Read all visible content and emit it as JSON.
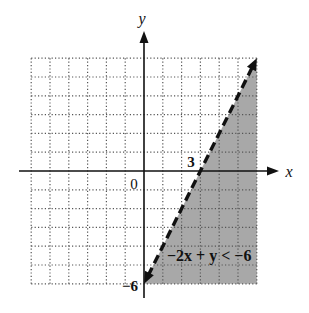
{
  "chart_data": {
    "type": "area",
    "title": "",
    "xlabel": "x",
    "ylabel": "y",
    "xlim": [
      -6,
      6
    ],
    "ylim": [
      -6,
      6
    ],
    "grid": true,
    "grid_style": "dotted",
    "boundary": {
      "equation": "y = 2x - 6",
      "style": "dashed",
      "points": [
        [
          0,
          -6
        ],
        [
          3,
          0
        ],
        [
          6,
          6
        ]
      ]
    },
    "inequality": "-2x + y < -6",
    "shaded_region": "below/right of boundary line",
    "shade_polygon": [
      [
        0,
        -6
      ],
      [
        6,
        6
      ],
      [
        6,
        -6
      ]
    ],
    "annotations": [
      {
        "text": "3",
        "at": [
          3,
          0
        ],
        "meaning": "x-intercept"
      },
      {
        "text": "−6",
        "at": [
          0,
          -6
        ],
        "meaning": "y-intercept"
      },
      {
        "text": "0",
        "at": [
          0,
          0
        ],
        "meaning": "origin"
      }
    ],
    "colors": {
      "shade": "#a8a8a8",
      "line": "#111111",
      "grid": "#555555"
    }
  },
  "labels": {
    "x_axis": "x",
    "y_axis": "y",
    "origin": "0",
    "x_intercept": "3",
    "y_intercept": "−6",
    "inequality": "−2x + y < −6"
  }
}
